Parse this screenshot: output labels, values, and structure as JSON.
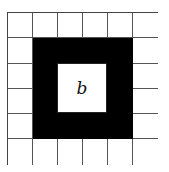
{
  "diagram": {
    "grid_rows": 6,
    "grid_cols": 6,
    "black_ring": {
      "row_start": 1,
      "row_end": 4,
      "col_start": 1,
      "col_end": 4
    },
    "inner_label": "b",
    "colors": {
      "ring": "#000000",
      "background": "#ffffff",
      "lines": "#555555"
    }
  }
}
